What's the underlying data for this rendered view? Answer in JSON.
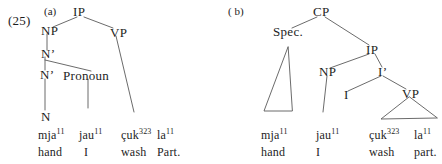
{
  "figure": {
    "example_number": "(25)",
    "accent_color": "#1d1d1d",
    "line_color": "#5a5a5a",
    "background": "#ffffff"
  },
  "tree_a": {
    "label": "(a)",
    "nodes": {
      "ip": "IP",
      "np": "NP",
      "vp": "VP",
      "nbar_upper": "N’",
      "nbar_lower": "N’",
      "pronoun": "Pronoun",
      "n": "N"
    },
    "terminals": [
      {
        "form": "mja",
        "tone": "11",
        "gloss": "hand"
      },
      {
        "form": "jau",
        "tone": "11",
        "gloss": "I"
      },
      {
        "form": "çuk",
        "tone": "323",
        "gloss": "wash"
      },
      {
        "form": "la",
        "tone": "11",
        "gloss": "Part."
      }
    ]
  },
  "tree_b": {
    "label": "( b)",
    "nodes": {
      "cp": "CP",
      "spec": "Spec.",
      "ip": "IP",
      "np": "NP",
      "ibar": "I’",
      "i": "I",
      "vp": "VP"
    },
    "terminals": [
      {
        "form": "mja",
        "tone": "11",
        "gloss": "hand"
      },
      {
        "form": "jau",
        "tone": "11",
        "gloss": "I"
      },
      {
        "form": "çuk",
        "tone": "323",
        "gloss": "wash"
      },
      {
        "form": "la",
        "tone": "11",
        "gloss": "part."
      }
    ]
  }
}
